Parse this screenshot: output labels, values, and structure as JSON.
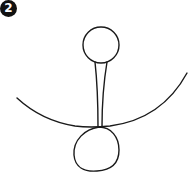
{
  "step_badge": {
    "label": "2",
    "color": "#111111",
    "text_color": "#ffffff"
  },
  "figure": {
    "stroke_color": "#1a1a1a",
    "background": "#ffffff",
    "parts": [
      "upper-circle",
      "stem",
      "arc",
      "lower-circle"
    ]
  }
}
